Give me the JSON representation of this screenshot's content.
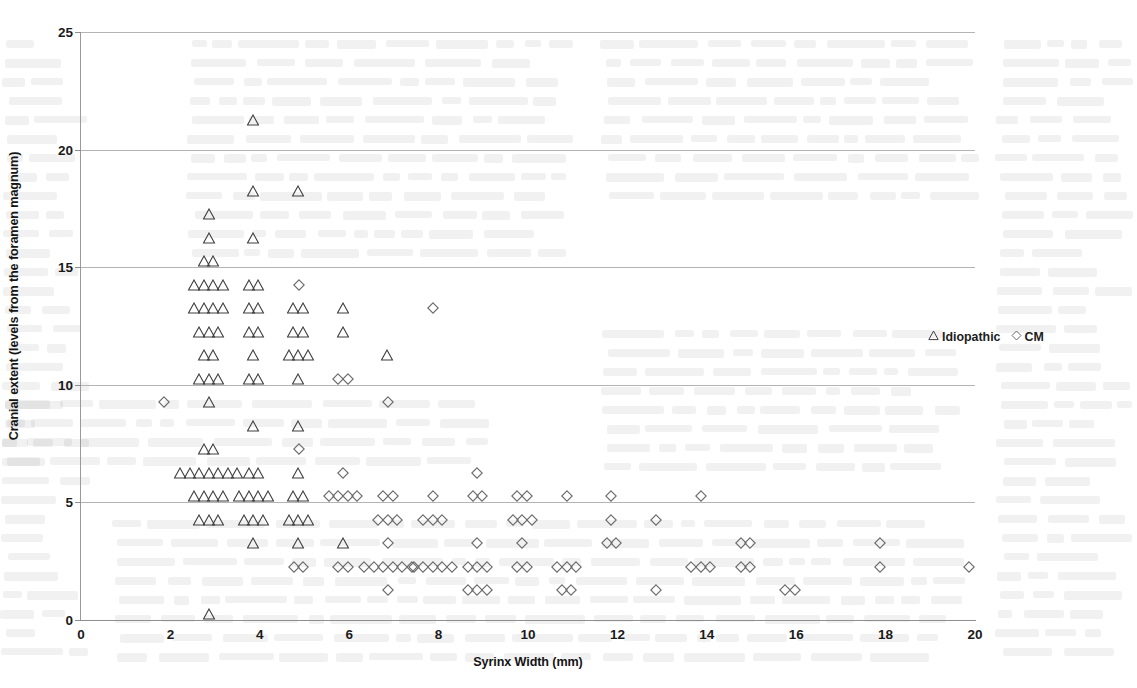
{
  "chart_data": {
    "type": "scatter",
    "title": "",
    "xlabel": "Syrinx Width (mm)",
    "ylabel": "Cranial extent (levels from the foramen magnum)",
    "xlim": [
      0,
      20
    ],
    "ylim": [
      0,
      25
    ],
    "xticks": [
      0,
      2,
      4,
      6,
      8,
      10,
      12,
      14,
      16,
      18,
      20
    ],
    "yticks": [
      0,
      5,
      10,
      15,
      20,
      25
    ],
    "grid": "horizontal",
    "legend_position": "right",
    "series": [
      {
        "name": "Idiopathic",
        "marker": "triangle",
        "color": "#3f3f3f",
        "points": [
          {
            "x": 4,
            "y": 21,
            "n": 1
          },
          {
            "x": 4,
            "y": 18,
            "n": 1
          },
          {
            "x": 5,
            "y": 18,
            "n": 1
          },
          {
            "x": 3,
            "y": 17,
            "n": 1
          },
          {
            "x": 3,
            "y": 16,
            "n": 1
          },
          {
            "x": 4,
            "y": 16,
            "n": 1
          },
          {
            "x": 3,
            "y": 15,
            "n": 2
          },
          {
            "x": 3,
            "y": 14,
            "n": 4
          },
          {
            "x": 4,
            "y": 14,
            "n": 2
          },
          {
            "x": 3,
            "y": 13,
            "n": 4
          },
          {
            "x": 4,
            "y": 13,
            "n": 2
          },
          {
            "x": 5,
            "y": 13,
            "n": 2
          },
          {
            "x": 6,
            "y": 13,
            "n": 1
          },
          {
            "x": 3,
            "y": 12,
            "n": 3
          },
          {
            "x": 4,
            "y": 12,
            "n": 2
          },
          {
            "x": 5,
            "y": 12,
            "n": 2
          },
          {
            "x": 6,
            "y": 12,
            "n": 1
          },
          {
            "x": 3,
            "y": 11,
            "n": 2
          },
          {
            "x": 4,
            "y": 11,
            "n": 1
          },
          {
            "x": 5,
            "y": 11,
            "n": 3
          },
          {
            "x": 7,
            "y": 11,
            "n": 1
          },
          {
            "x": 3,
            "y": 10,
            "n": 3
          },
          {
            "x": 4,
            "y": 10,
            "n": 2
          },
          {
            "x": 5,
            "y": 10,
            "n": 1
          },
          {
            "x": 3,
            "y": 9,
            "n": 1
          },
          {
            "x": 4,
            "y": 8,
            "n": 1
          },
          {
            "x": 5,
            "y": 8,
            "n": 1
          },
          {
            "x": 3,
            "y": 7,
            "n": 2
          },
          {
            "x": 3,
            "y": 6,
            "n": 7
          },
          {
            "x": 4,
            "y": 6,
            "n": 2
          },
          {
            "x": 5,
            "y": 6,
            "n": 1
          },
          {
            "x": 3,
            "y": 5,
            "n": 4
          },
          {
            "x": 4,
            "y": 5,
            "n": 4
          },
          {
            "x": 5,
            "y": 5,
            "n": 2
          },
          {
            "x": 3,
            "y": 4,
            "n": 3
          },
          {
            "x": 4,
            "y": 4,
            "n": 3
          },
          {
            "x": 5,
            "y": 4,
            "n": 3
          },
          {
            "x": 4,
            "y": 3,
            "n": 1
          },
          {
            "x": 5,
            "y": 3,
            "n": 1
          },
          {
            "x": 6,
            "y": 3,
            "n": 1
          },
          {
            "x": 3,
            "y": 0,
            "n": 1
          }
        ]
      },
      {
        "name": "CM",
        "marker": "diamond",
        "color": "#6a6a6a",
        "points": [
          {
            "x": 5,
            "y": 14,
            "n": 1
          },
          {
            "x": 8,
            "y": 13,
            "n": 1
          },
          {
            "x": 6,
            "y": 10,
            "n": 2
          },
          {
            "x": 2,
            "y": 9,
            "n": 1
          },
          {
            "x": 7,
            "y": 9,
            "n": 1
          },
          {
            "x": 5,
            "y": 7,
            "n": 1
          },
          {
            "x": 6,
            "y": 6,
            "n": 1
          },
          {
            "x": 9,
            "y": 6,
            "n": 1
          },
          {
            "x": 6,
            "y": 5,
            "n": 4
          },
          {
            "x": 7,
            "y": 5,
            "n": 2
          },
          {
            "x": 8,
            "y": 5,
            "n": 1
          },
          {
            "x": 9,
            "y": 5,
            "n": 2
          },
          {
            "x": 10,
            "y": 5,
            "n": 2
          },
          {
            "x": 11,
            "y": 5,
            "n": 1
          },
          {
            "x": 12,
            "y": 5,
            "n": 1
          },
          {
            "x": 14,
            "y": 5,
            "n": 1
          },
          {
            "x": 7,
            "y": 4,
            "n": 3
          },
          {
            "x": 8,
            "y": 4,
            "n": 3
          },
          {
            "x": 10,
            "y": 4,
            "n": 3
          },
          {
            "x": 12,
            "y": 4,
            "n": 1
          },
          {
            "x": 13,
            "y": 4,
            "n": 1
          },
          {
            "x": 7,
            "y": 3,
            "n": 1
          },
          {
            "x": 9,
            "y": 3,
            "n": 1
          },
          {
            "x": 10,
            "y": 3,
            "n": 1
          },
          {
            "x": 12,
            "y": 3,
            "n": 2
          },
          {
            "x": 15,
            "y": 3,
            "n": 2
          },
          {
            "x": 18,
            "y": 3,
            "n": 1
          },
          {
            "x": 5,
            "y": 2,
            "n": 2
          },
          {
            "x": 6,
            "y": 2,
            "n": 2
          },
          {
            "x": 7,
            "y": 2,
            "n": 6
          },
          {
            "x": 8,
            "y": 2,
            "n": 5
          },
          {
            "x": 9,
            "y": 2,
            "n": 3
          },
          {
            "x": 10,
            "y": 2,
            "n": 2
          },
          {
            "x": 11,
            "y": 2,
            "n": 3
          },
          {
            "x": 14,
            "y": 2,
            "n": 3
          },
          {
            "x": 15,
            "y": 2,
            "n": 2
          },
          {
            "x": 18,
            "y": 2,
            "n": 1
          },
          {
            "x": 20,
            "y": 2,
            "n": 1
          },
          {
            "x": 7,
            "y": 1,
            "n": 1
          },
          {
            "x": 9,
            "y": 1,
            "n": 3
          },
          {
            "x": 11,
            "y": 1,
            "n": 2
          },
          {
            "x": 13,
            "y": 1,
            "n": 1
          },
          {
            "x": 16,
            "y": 1,
            "n": 2
          }
        ]
      }
    ]
  },
  "legend": {
    "idiopathic_label": "Idiopathic",
    "cm_label": "CM"
  },
  "axes": {
    "x_title": "Syrinx Width (mm)",
    "y_title": "Cranial extent (levels from the foramen magnum)"
  }
}
